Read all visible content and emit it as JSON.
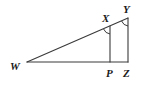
{
  "figure": {
    "kind": "geometry-diagram",
    "name": "similar-triangles-WXP-WYZ",
    "background_color": "#ffffff",
    "stroke_color": "#3a3a3a",
    "label_color": "#1a1a1a",
    "stroke_width": 1.1
  },
  "points": {
    "W": {
      "label": "W",
      "x": 27,
      "y": 62,
      "label_x": 10,
      "label_y": 70
    },
    "X": {
      "label": "X",
      "x": 110,
      "y": 26,
      "label_x": 102,
      "label_y": 22
    },
    "Y": {
      "label": "Y",
      "x": 128,
      "y": 18,
      "label_x": 123,
      "label_y": 13
    },
    "P": {
      "label": "P",
      "x": 110,
      "y": 62,
      "label_x": 106,
      "label_y": 77
    },
    "Z": {
      "label": "Z",
      "x": 128,
      "y": 62,
      "label_x": 123,
      "label_y": 77
    }
  },
  "segments": [
    {
      "name": "segment-WY",
      "from": "W",
      "to": "Y"
    },
    {
      "name": "segment-WZ",
      "from": "W",
      "to": "Z"
    },
    {
      "name": "segment-XP",
      "from": "X",
      "to": "P"
    },
    {
      "name": "segment-YZ",
      "from": "Y",
      "to": "Z"
    }
  ],
  "angle_marks": [
    {
      "name": "angle-mark-X",
      "vertex": "X",
      "path": "M 103.6 29.0 A 8 8 0 0 0 110 34"
    },
    {
      "name": "angle-mark-Y",
      "vertex": "Y",
      "path": "M 121.6 21.0 A 8 8 0 0 0 128 26"
    }
  ],
  "labels": [
    "W",
    "X",
    "Y",
    "P",
    "Z"
  ]
}
